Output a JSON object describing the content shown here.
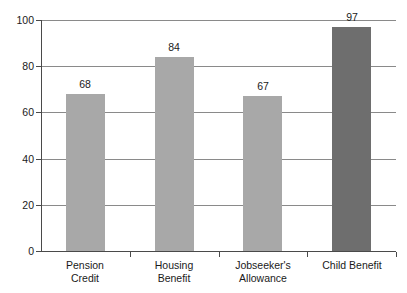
{
  "chart_data": {
    "type": "bar",
    "title": "",
    "subtitle": "",
    "xlabel": "",
    "ylabel": "",
    "categories": [
      "Pension Credit",
      "Housing Benefit",
      "Jobseeker's Allowance",
      "Child Benefit"
    ],
    "category_lines": [
      [
        "Pension",
        "Credit"
      ],
      [
        "Housing",
        "Benefit"
      ],
      [
        "Jobseeker's",
        "Allowance"
      ],
      [
        "Child Benefit"
      ]
    ],
    "values": [
      68,
      84,
      67,
      97
    ],
    "value_labels": [
      "68",
      "84",
      "67",
      "97"
    ],
    "bar_colors": [
      "#a8a8a8",
      "#a8a8a8",
      "#a8a8a8",
      "#6e6e6e"
    ],
    "ylim": [
      0,
      100
    ],
    "ytick_labels": [
      "0",
      "20",
      "40",
      "60",
      "80",
      "100"
    ],
    "ytick_values": [
      0,
      20,
      40,
      60,
      80,
      100
    ],
    "grid": true,
    "grid_axis": "y",
    "legend": false,
    "legend_position": "none",
    "axis_color": "#4a4a4a",
    "grid_color": "#8a8a8a",
    "background_color": "#ffffff",
    "text_color": "#1a1a1a"
  }
}
